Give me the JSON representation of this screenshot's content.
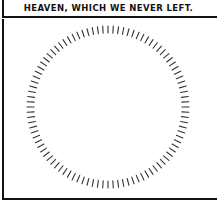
{
  "caption": {
    "text": "HEAVEN, WHICH WE NEVER LEFT."
  },
  "panel": {
    "figure": "circle-of-tick-marks",
    "tick_count": 96,
    "tick_color": "#333333",
    "center": [
      108,
      107
    ],
    "radius": 78
  }
}
